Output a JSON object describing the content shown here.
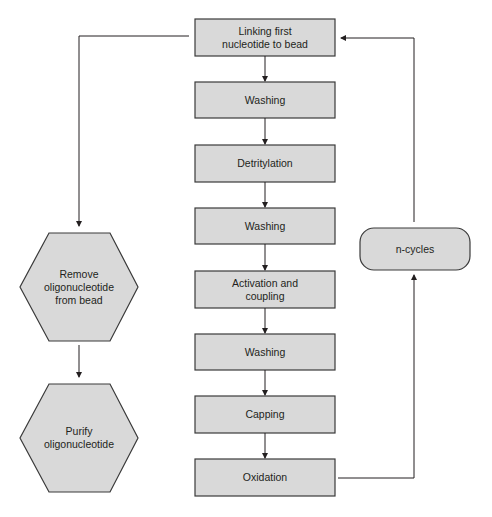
{
  "diagram": {
    "colors": {
      "box_fill": "#d9d9d9",
      "stroke": "#3a3a3a",
      "background": "#ffffff"
    },
    "steps": [
      {
        "id": "link",
        "label": "Linking first\nnucleotide to bead"
      },
      {
        "id": "wash1",
        "label": "Washing"
      },
      {
        "id": "detritylation",
        "label": "Detritylation"
      },
      {
        "id": "wash2",
        "label": "Washing"
      },
      {
        "id": "activation",
        "label": "Activation and\ncoupling"
      },
      {
        "id": "wash3",
        "label": "Washing"
      },
      {
        "id": "capping",
        "label": "Capping"
      },
      {
        "id": "oxidation",
        "label": "Oxidation"
      }
    ],
    "loop": {
      "label": "n-cycles"
    },
    "post_steps": [
      {
        "id": "remove",
        "label": "Remove\noligonucleotide\nfrom bead"
      },
      {
        "id": "purify",
        "label": "Purify\noligonucleotide"
      }
    ]
  }
}
